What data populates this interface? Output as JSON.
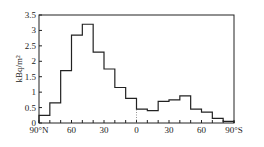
{
  "chart_data": {
    "type": "bar",
    "subtype": "step-histogram",
    "title": "",
    "xlabel": "",
    "ylabel": "kBq/m²",
    "ylim": [
      0,
      3.5
    ],
    "xlim": [
      90,
      -90
    ],
    "y_ticks": [
      "0",
      "0.5",
      "1",
      "1.5",
      "2",
      "2.5",
      "3",
      "3.5"
    ],
    "x_ticks": [
      "90°N",
      "60",
      "30",
      "0",
      "30",
      "60",
      "90°S"
    ],
    "grid": false,
    "legend": null,
    "categories": [
      "90-80N",
      "80-70N",
      "70-60N",
      "60-50N",
      "50-40N",
      "40-30N",
      "30-20N",
      "20-10N",
      "10-0N",
      "0-10S",
      "10-20S",
      "20-30S",
      "30-40S",
      "40-50S",
      "50-60S",
      "60-70S",
      "70-80S",
      "80-90S"
    ],
    "values": [
      0.25,
      0.65,
      1.7,
      2.85,
      3.2,
      2.3,
      1.75,
      1.15,
      0.8,
      0.45,
      0.4,
      0.7,
      0.75,
      0.88,
      0.45,
      0.35,
      0.15,
      0.05
    ]
  },
  "labels": {
    "ylabel": "kBq/m²"
  }
}
